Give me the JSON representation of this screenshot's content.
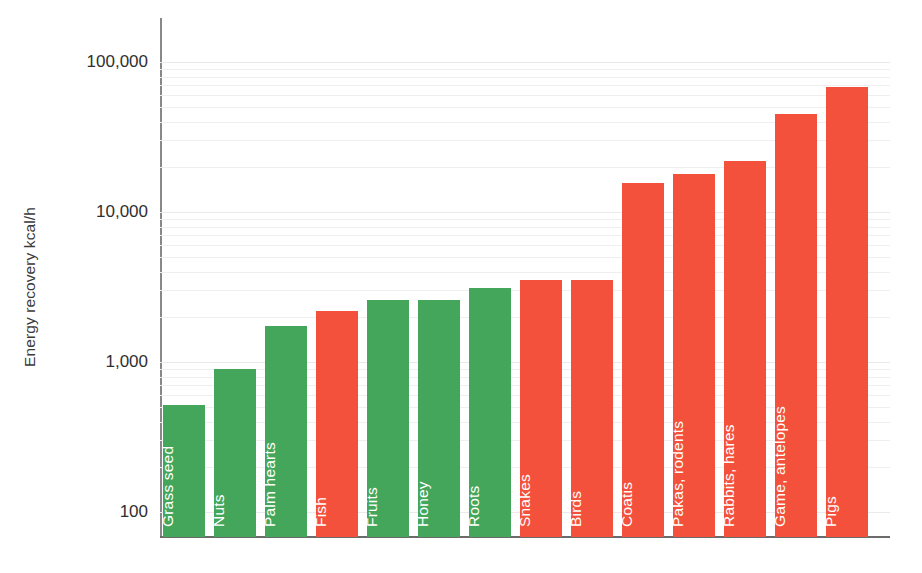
{
  "chart_data": {
    "type": "bar",
    "title": "",
    "xlabel": "",
    "ylabel": "Energy recovery kcal/h",
    "yscale": "log",
    "ylim": [
      100,
      100000
    ],
    "ytick_labels": [
      "100,000",
      "10,000",
      "1,000",
      "100"
    ],
    "ytick_values": [
      100000,
      10000,
      1000,
      100
    ],
    "grid": true,
    "legend": "none",
    "categories": [
      "Grass seed",
      "Nuts",
      "Palm hearts",
      "Fish",
      "Fruits",
      "Honey",
      "Roots",
      "Snakes",
      "Birds",
      "Coatis",
      "Pakas, rodents",
      "Rabbits, hares",
      "Game, antelopes",
      "Pigs"
    ],
    "values": [
      520,
      900,
      1750,
      2200,
      2600,
      2600,
      3100,
      3500,
      3500,
      15500,
      18000,
      22000,
      45000,
      68000
    ],
    "bar_colors": [
      "#43a65a",
      "#43a65a",
      "#43a65a",
      "#f4513c",
      "#43a65a",
      "#43a65a",
      "#43a65a",
      "#f4513c",
      "#f4513c",
      "#f4513c",
      "#f4513c",
      "#f4513c",
      "#f4513c",
      "#f4513c"
    ],
    "color_green": "#43a65a",
    "color_red": "#f4513c",
    "axis_color": "#6b6b6b",
    "gridline_color": "#efedf0",
    "label_text_color": "#ffffff",
    "tick_text_color": "#2f2f2f"
  }
}
